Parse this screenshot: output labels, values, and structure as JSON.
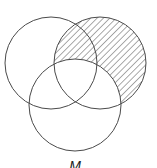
{
  "diagram": {
    "type": "venn-diagram",
    "sets": [
      {
        "id": "A",
        "position": "top-left",
        "cx": 51,
        "cy": 63,
        "r": 46
      },
      {
        "id": "B",
        "position": "top-right",
        "cx": 100,
        "cy": 63,
        "r": 46
      },
      {
        "id": "C",
        "position": "bottom",
        "cx": 75,
        "cy": 105,
        "r": 46
      }
    ],
    "shaded_region": {
      "description": "top-right set minus bottom set",
      "pattern": "diagonal-hatch",
      "color": "#555555"
    },
    "label": "M",
    "colors": {
      "stroke": "#4a4a4a",
      "hatch": "#555555",
      "background": "#ffffff",
      "label": "#222222"
    }
  }
}
